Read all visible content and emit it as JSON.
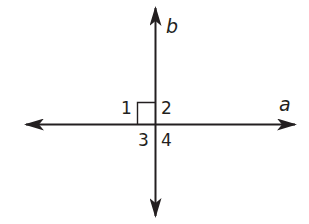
{
  "diagram": {
    "type": "perpendicular-lines",
    "colors": {
      "line": "#231f20",
      "background": "#ffffff"
    },
    "lines": [
      {
        "id": "a",
        "label": "a",
        "orientation": "horizontal",
        "arrows": "both"
      },
      {
        "id": "b",
        "label": "b",
        "orientation": "vertical",
        "arrows": "both"
      }
    ],
    "right_angle_marker": {
      "in_angle": "1"
    },
    "angles": [
      {
        "label": "1",
        "position": "upper-left"
      },
      {
        "label": "2",
        "position": "upper-right"
      },
      {
        "label": "3",
        "position": "lower-left"
      },
      {
        "label": "4",
        "position": "lower-right"
      }
    ]
  }
}
